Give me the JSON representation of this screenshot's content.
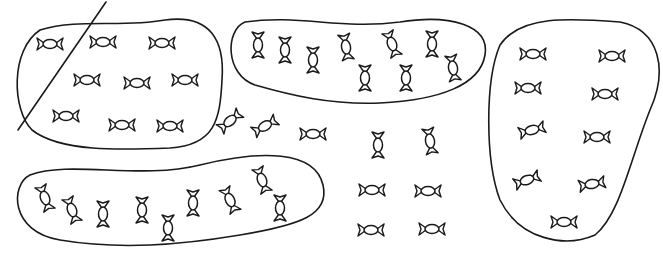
{
  "diagram": {
    "colors": {
      "stroke": "#1a1a1a",
      "background": "#ffffff"
    },
    "slash_line": {
      "x1": 106,
      "y1": 2,
      "x2": 18,
      "y2": 130
    },
    "groups": [
      {
        "id": "group-top-left",
        "count": 9,
        "crossed_out": true,
        "outline_path": "M40,30 C80,18 120,28 165,20 C210,14 225,40 222,80 C220,120 215,145 170,148 C120,150 60,152 32,130 C12,110 10,50 40,30 Z",
        "candies": [
          {
            "x": 50,
            "y": 44,
            "rot": 0
          },
          {
            "x": 103,
            "y": 42,
            "rot": 0
          },
          {
            "x": 162,
            "y": 43,
            "rot": 0
          },
          {
            "x": 87,
            "y": 80,
            "rot": 0
          },
          {
            "x": 137,
            "y": 83,
            "rot": 0
          },
          {
            "x": 185,
            "y": 80,
            "rot": 0
          },
          {
            "x": 66,
            "y": 116,
            "rot": 0
          },
          {
            "x": 122,
            "y": 125,
            "rot": 0
          },
          {
            "x": 170,
            "y": 126,
            "rot": 0
          }
        ]
      },
      {
        "id": "group-top-middle",
        "count": 9,
        "crossed_out": false,
        "outline_path": "M245,22 C300,14 340,30 400,22 C450,14 490,25 485,55 C480,85 440,100 380,103 C330,105 290,95 255,85 C225,75 225,30 245,22 Z",
        "candies": [
          {
            "x": 258,
            "y": 45,
            "rot": 90
          },
          {
            "x": 285,
            "y": 50,
            "rot": 90
          },
          {
            "x": 313,
            "y": 60,
            "rot": 90
          },
          {
            "x": 346,
            "y": 47,
            "rot": 80
          },
          {
            "x": 392,
            "y": 44,
            "rot": 70
          },
          {
            "x": 432,
            "y": 44,
            "rot": 90
          },
          {
            "x": 365,
            "y": 78,
            "rot": 90
          },
          {
            "x": 406,
            "y": 78,
            "rot": 90
          },
          {
            "x": 453,
            "y": 68,
            "rot": 80
          }
        ]
      },
      {
        "id": "group-right",
        "count": 9,
        "crossed_out": false,
        "outline_path": "M500,45 C520,15 570,18 620,22 C660,30 668,70 650,110 C630,160 620,215 595,235 C565,248 520,240 500,200 C485,160 485,80 500,45 Z",
        "candies": [
          {
            "x": 533,
            "y": 54,
            "rot": 0
          },
          {
            "x": 612,
            "y": 56,
            "rot": 0
          },
          {
            "x": 528,
            "y": 88,
            "rot": 0
          },
          {
            "x": 605,
            "y": 94,
            "rot": 0
          },
          {
            "x": 532,
            "y": 130,
            "rot": -15
          },
          {
            "x": 597,
            "y": 137,
            "rot": 0
          },
          {
            "x": 527,
            "y": 180,
            "rot": -20
          },
          {
            "x": 592,
            "y": 184,
            "rot": -10
          },
          {
            "x": 564,
            "y": 222,
            "rot": 0
          }
        ]
      },
      {
        "id": "group-bottom-left",
        "count": 9,
        "crossed_out": false,
        "outline_path": "M30,175 C70,160 140,180 200,165 C260,150 315,150 323,185 C330,215 300,225 240,235 C180,245 120,250 60,240 C10,232 10,185 30,175 Z",
        "candies": [
          {
            "x": 45,
            "y": 198,
            "rot": 70
          },
          {
            "x": 72,
            "y": 210,
            "rot": 70
          },
          {
            "x": 103,
            "y": 214,
            "rot": 90
          },
          {
            "x": 142,
            "y": 210,
            "rot": 90
          },
          {
            "x": 168,
            "y": 228,
            "rot": 90
          },
          {
            "x": 193,
            "y": 203,
            "rot": 90
          },
          {
            "x": 230,
            "y": 200,
            "rot": 65
          },
          {
            "x": 262,
            "y": 180,
            "rot": 70
          },
          {
            "x": 280,
            "y": 208,
            "rot": 90
          }
        ]
      }
    ],
    "loose_candies": {
      "count": 9,
      "candies": [
        {
          "x": 230,
          "y": 121,
          "rot": -40
        },
        {
          "x": 265,
          "y": 126,
          "rot": -30
        },
        {
          "x": 313,
          "y": 134,
          "rot": 0
        },
        {
          "x": 378,
          "y": 145,
          "rot": 90
        },
        {
          "x": 430,
          "y": 141,
          "rot": 80
        },
        {
          "x": 372,
          "y": 190,
          "rot": 0
        },
        {
          "x": 428,
          "y": 191,
          "rot": 0
        },
        {
          "x": 371,
          "y": 230,
          "rot": 0
        },
        {
          "x": 432,
          "y": 229,
          "rot": 0
        }
      ]
    },
    "totals": {
      "grouped": 36,
      "loose": 9,
      "all": 45
    }
  }
}
